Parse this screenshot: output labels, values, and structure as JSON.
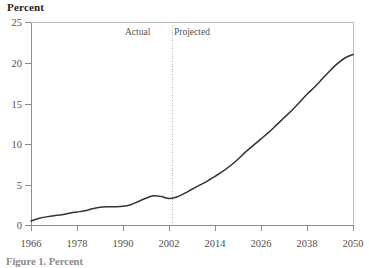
{
  "chart_data": {
    "type": "line",
    "title": "Percent",
    "xlabel": "",
    "ylabel": "Percent",
    "xlim": [
      1966,
      2050
    ],
    "ylim": [
      0,
      25
    ],
    "grid": false,
    "legend": "none",
    "x_ticks": [
      "1966",
      "1978",
      "1990",
      "2002",
      "2014",
      "2026",
      "2038",
      "2050"
    ],
    "y_ticks": [
      "0",
      "5",
      "10",
      "15",
      "20",
      "25"
    ],
    "annotations": [
      {
        "text": "Actual",
        "x": 1996
      },
      {
        "text": "Projected",
        "x": 2010
      }
    ],
    "divider_year": 2003,
    "series": [
      {
        "name": "Percent",
        "x": [
          1966,
          1968,
          1970,
          1972,
          1974,
          1976,
          1978,
          1980,
          1982,
          1984,
          1986,
          1988,
          1990,
          1992,
          1994,
          1996,
          1998,
          2000,
          2002,
          2004,
          2006,
          2008,
          2010,
          2012,
          2014,
          2016,
          2018,
          2020,
          2022,
          2024,
          2026,
          2028,
          2030,
          2032,
          2034,
          2036,
          2038,
          2040,
          2042,
          2044,
          2046,
          2048,
          2050
        ],
        "values": [
          0.5,
          0.8,
          1.0,
          1.15,
          1.25,
          1.45,
          1.6,
          1.75,
          2.0,
          2.2,
          2.25,
          2.25,
          2.3,
          2.5,
          2.9,
          3.3,
          3.6,
          3.5,
          3.25,
          3.45,
          3.9,
          4.4,
          4.9,
          5.4,
          6.0,
          6.6,
          7.3,
          8.1,
          9.0,
          9.8,
          10.6,
          11.4,
          12.3,
          13.2,
          14.1,
          15.1,
          16.1,
          17.0,
          18.0,
          19.0,
          19.9,
          20.6,
          21.0
        ]
      }
    ]
  },
  "figure": {
    "caption": "Figure 1. Percent"
  },
  "colors": {
    "line": "#333333",
    "axis": "#8c8c8c",
    "divider": "#b9b9b9",
    "text": "#54504f"
  }
}
